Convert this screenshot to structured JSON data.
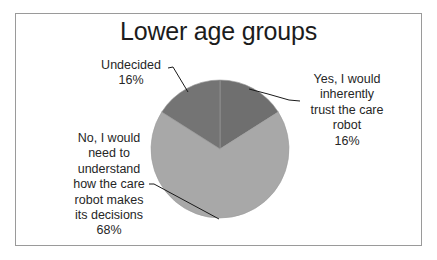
{
  "chart_data": {
    "type": "pie",
    "title": "Lower age groups",
    "categories": [
      "Yes, I would inherently trust the care robot",
      "No, I would need to understand how the care robot makes its decisions",
      "Undecided"
    ],
    "values": [
      16,
      68,
      16
    ],
    "unit": "%",
    "colors": [
      "#6f6f6f",
      "#a8a8a8",
      "#747474"
    ],
    "start_angle_deg": 0,
    "direction": "clockwise",
    "legend": "none (data labels with leader lines)",
    "data_labels": [
      {
        "lines": [
          "Yes, I would",
          "inherently",
          "trust the care",
          "robot"
        ],
        "percent": "16%"
      },
      {
        "lines": [
          "No, I would",
          "need to",
          "understand",
          "how the care",
          "robot makes",
          "its decisions"
        ],
        "percent": "68%"
      },
      {
        "lines": [
          "Undecided"
        ],
        "percent": "16%"
      }
    ]
  },
  "labels": {
    "yes": {
      "l1": "Yes, I would",
      "l2": "inherently",
      "l3": "trust the care",
      "l4": "robot",
      "pct": "16%"
    },
    "no": {
      "l1": "No, I would",
      "l2": "need to",
      "l3": "understand",
      "l4": "how the care",
      "l5": "robot makes",
      "l6": "its decisions",
      "pct": "68%"
    },
    "undecided": {
      "l1": "Undecided",
      "pct": "16%"
    }
  }
}
